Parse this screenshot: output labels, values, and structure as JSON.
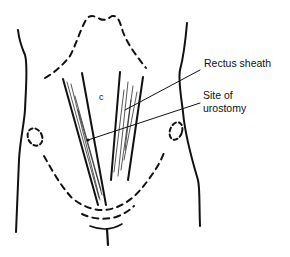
{
  "diagram": {
    "labels": {
      "rectus_sheath": "Rectus sheath",
      "site_line1": "Site of",
      "site_line2": "urostomy",
      "umbilicus_mark": "c"
    },
    "colors": {
      "ink": "#111111",
      "background": "#ffffff"
    }
  }
}
